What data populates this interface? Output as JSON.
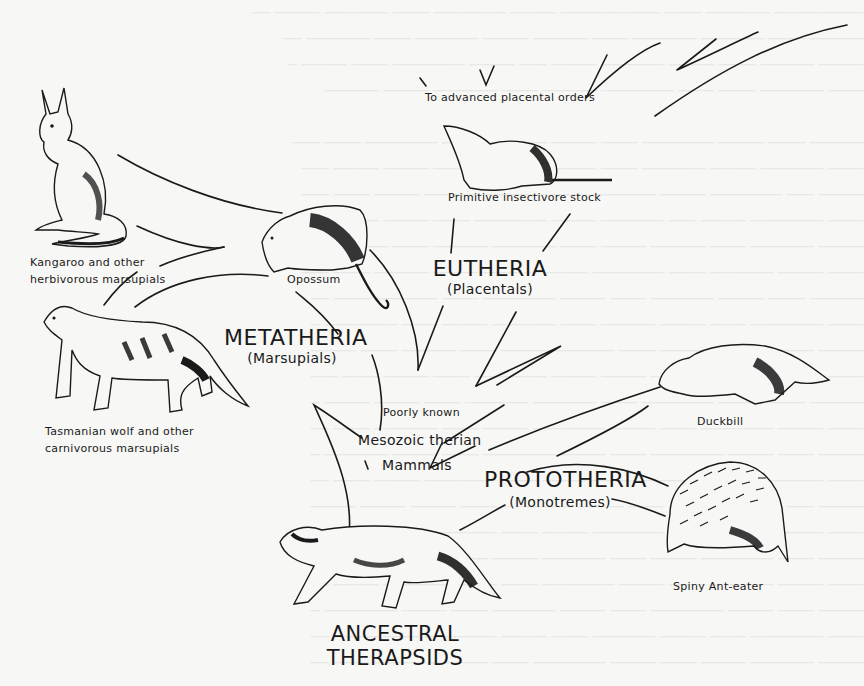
{
  "diagram": {
    "type": "phylogenetic-tree",
    "root": {
      "label_line1": "ANCESTRAL",
      "label_line2": "THERAPSIDS"
    },
    "intermediate": {
      "note": "Poorly known",
      "label_line1": "Mesozoic therian",
      "label_line2": "Mammals"
    },
    "groups": {
      "metatheria": {
        "name": "METATHERIA",
        "common": "(Marsupials)"
      },
      "eutheria": {
        "name": "EUTHERIA",
        "common": "(Placentals)"
      },
      "prototheria": {
        "name": "PROTOTHERIA",
        "common": "(Monotremes)"
      }
    },
    "animals": {
      "kangaroo": {
        "line1": "Kangaroo and other",
        "line2": "herbivorous marsupials"
      },
      "tasmanian_wolf": {
        "line1": "Tasmanian wolf and other",
        "line2": "carnivorous marsupials"
      },
      "opossum": {
        "label": "Opossum"
      },
      "insectivore": {
        "label": "Primitive insectivore stock"
      },
      "duckbill": {
        "label": "Duckbill"
      },
      "spiny_anteater": {
        "label": "Spiny Ant-eater"
      }
    },
    "advanced": {
      "label": "To advanced placental orders"
    },
    "colors": {
      "ink": "#1a1a1a",
      "paper": "#f7f7f5"
    }
  }
}
